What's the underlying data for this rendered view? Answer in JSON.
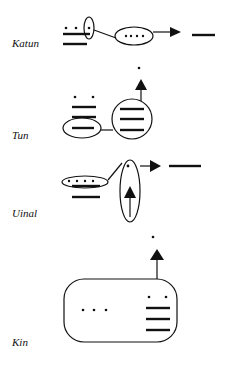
{
  "diagram": {
    "colors": {
      "ink": "#111111",
      "background": "#ffffff"
    },
    "rows": [
      {
        "id": "katun",
        "label": "Katun"
      },
      {
        "id": "tun",
        "label": "Tun"
      },
      {
        "id": "uinal",
        "label": "Uinal"
      },
      {
        "id": "kin",
        "label": "Kin"
      }
    ]
  }
}
